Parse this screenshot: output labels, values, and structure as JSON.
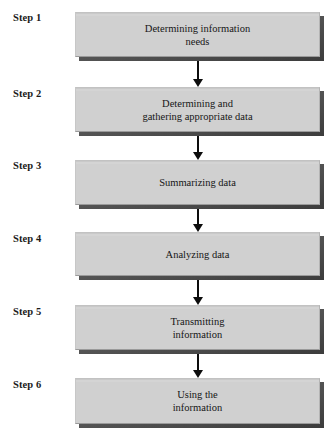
{
  "diagram": {
    "type": "vertical-flowchart",
    "background_color": "#ffffff",
    "box_fill_color": "#d0d0d0",
    "box_shadow_color": "#4a4a4a",
    "arrow_color": "#0d0d0d",
    "text_color": "#161616",
    "steps": [
      {
        "label": "Step 1",
        "text": "Determining information\nneeds",
        "label_top": 12,
        "box_top": 12,
        "box_height": 45
      },
      {
        "label": "Step 2",
        "text": "Determining and\ngathering appropriate data",
        "label_top": 88,
        "box_top": 87,
        "box_height": 45
      },
      {
        "label": "Step 3",
        "text": "Summarizing data",
        "label_top": 160,
        "box_top": 160,
        "box_height": 45
      },
      {
        "label": "Step 4",
        "text": "Analyzing data",
        "label_top": 233,
        "box_top": 232,
        "box_height": 44
      },
      {
        "label": "Step 5",
        "text": "Transmitting\ninformation",
        "label_top": 306,
        "box_top": 305,
        "box_height": 45
      },
      {
        "label": "Step 6",
        "text": "Using the\ninformation",
        "label_top": 379,
        "box_top": 378,
        "box_height": 46
      }
    ],
    "connectors": [
      {
        "name": "arrow-step1-step2",
        "top": 61,
        "length": 26
      },
      {
        "name": "arrow-step2-step3",
        "top": 136,
        "length": 24
      },
      {
        "name": "arrow-step3-step4",
        "top": 209,
        "length": 23
      },
      {
        "name": "arrow-step4-step5",
        "top": 280,
        "length": 25
      },
      {
        "name": "arrow-step5-step6",
        "top": 354,
        "length": 24
      }
    ]
  }
}
